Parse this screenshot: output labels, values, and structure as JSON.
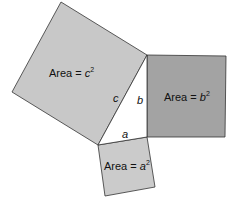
{
  "diagram": {
    "type": "pythagorean-theorem",
    "colors": {
      "square_c": "#c8c8c8",
      "square_b": "#a3a3a3",
      "square_a": "#cbcbcb",
      "stroke": "#333333",
      "triangle": "#ffffff"
    },
    "squares": {
      "c": {
        "label_prefix": "Area = ",
        "var": "c",
        "exp": "2"
      },
      "b": {
        "label_prefix": "Area = ",
        "var": "b",
        "exp": "2"
      },
      "a": {
        "label_prefix": "Area = ",
        "var": "a",
        "exp": "2"
      }
    },
    "sides": {
      "c": "c",
      "b": "b",
      "a": "a"
    }
  }
}
